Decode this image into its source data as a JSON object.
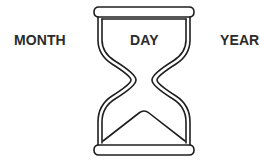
{
  "labels": {
    "month": "MONTH",
    "day": "DAY",
    "year": "YEAR"
  },
  "illustration": {
    "icon": "hourglass-icon",
    "stroke_color": "#1f1f1f",
    "background": "#ffffff"
  }
}
